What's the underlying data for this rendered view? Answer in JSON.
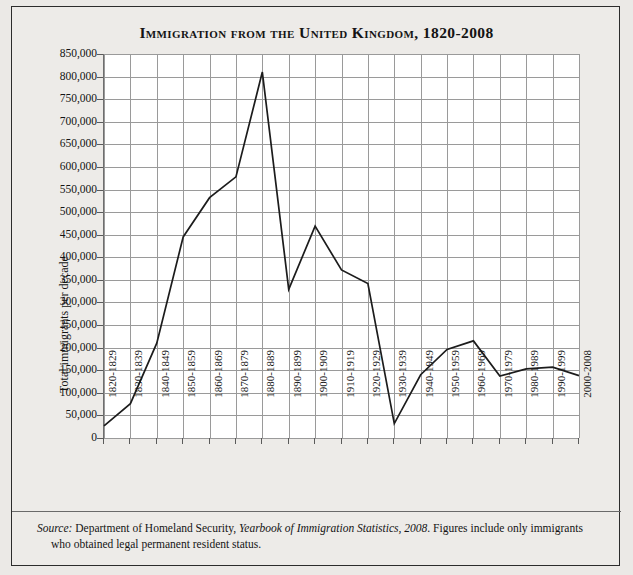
{
  "chart_data": {
    "type": "line",
    "title": "Immigration from the United Kingdom, 1820-2008",
    "xlabel": "",
    "ylabel": "Total immigrants per decade",
    "ylim": [
      0,
      850000
    ],
    "ytick_step": 50000,
    "grid": true,
    "legend": "none",
    "categories": [
      "1820-1829",
      "1830-1839",
      "1840-1849",
      "1850-1859",
      "1860-1869",
      "1870-1879",
      "1880-1889",
      "1890-1899",
      "1900-1909",
      "1910-1919",
      "1920-1929",
      "1930-1939",
      "1940-1949",
      "1950-1959",
      "1960-1969",
      "1970-1979",
      "1980-1989",
      "1990-1999",
      "2000-2008"
    ],
    "values": [
      27000,
      76000,
      210000,
      445000,
      532000,
      578000,
      810000,
      329000,
      469000,
      372000,
      342000,
      32000,
      140000,
      196000,
      215000,
      137000,
      153000,
      157000,
      138000
    ],
    "ytick_labels": [
      "850,000",
      "800,000",
      "750,000",
      "700,000",
      "650,000",
      "600,000",
      "550,000",
      "500,000",
      "450,000",
      "400,000",
      "350,000",
      "300,000",
      "250,000",
      "200,000",
      "150,000",
      "100,000",
      "50,000",
      "0"
    ],
    "ytick_values": [
      850000,
      800000,
      750000,
      700000,
      650000,
      600000,
      550000,
      500000,
      450000,
      400000,
      350000,
      300000,
      250000,
      200000,
      150000,
      100000,
      50000,
      0
    ],
    "line_color": "#1c1c1c"
  },
  "source": {
    "label": "Source:",
    "text_1": " Department of Homeland Security, ",
    "publication": "Yearbook of Immigration Statistics, 2008",
    "text_2": ". Figures include only immigrants who obtained legal permanent resident status."
  }
}
